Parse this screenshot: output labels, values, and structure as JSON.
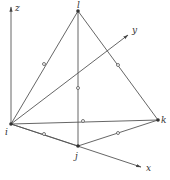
{
  "diagram": {
    "type": "tetrahedral element in 3D coordinate system",
    "stroke_color": "#555555",
    "axes": [
      {
        "name": "z",
        "label": "z",
        "from": [
          11,
          124
        ],
        "to": [
          11,
          7
        ],
        "label_pos": [
          15,
          11
        ]
      },
      {
        "name": "y",
        "label": "y",
        "from": [
          11,
          124
        ],
        "to": [
          128,
          35
        ],
        "label_pos": [
          132,
          33
        ]
      },
      {
        "name": "x",
        "label": "x",
        "from": [
          11,
          124
        ],
        "to": [
          141,
          167
        ],
        "label_pos": [
          146,
          171
        ]
      }
    ],
    "vertices": [
      {
        "id": "l",
        "label": "l",
        "pos": [
          78,
          11
        ],
        "label_pos": [
          77,
          8
        ]
      },
      {
        "id": "i",
        "label": "i",
        "pos": [
          11,
          124
        ],
        "label_pos": [
          5,
          135
        ]
      },
      {
        "id": "j",
        "label": "j",
        "pos": [
          78,
          146
        ],
        "label_pos": [
          75,
          159
        ]
      },
      {
        "id": "k",
        "label": "k",
        "pos": [
          158,
          120
        ],
        "label_pos": [
          161,
          123
        ]
      }
    ],
    "edges": [
      {
        "from": "l",
        "to": "i"
      },
      {
        "from": "l",
        "to": "j"
      },
      {
        "from": "l",
        "to": "k"
      },
      {
        "from": "i",
        "to": "j"
      },
      {
        "from": "i",
        "to": "k"
      },
      {
        "from": "j",
        "to": "k"
      }
    ],
    "midpoint_nodes": [
      {
        "edge": "il",
        "pos": [
          44,
          64
        ]
      },
      {
        "edge": "lk",
        "pos": [
          118,
          65
        ]
      },
      {
        "edge": "lj",
        "pos": [
          78,
          88
        ]
      },
      {
        "edge": "ik",
        "pos": [
          83,
          121
        ]
      },
      {
        "edge": "ij",
        "pos": [
          44,
          134
        ]
      },
      {
        "edge": "jk",
        "pos": [
          118,
          133
        ]
      }
    ]
  }
}
